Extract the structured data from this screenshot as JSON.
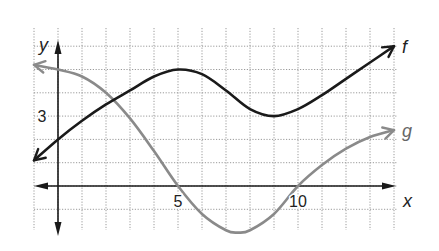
{
  "chart_data": {
    "type": "line",
    "title": "",
    "xlabel": "x",
    "ylabel": "y",
    "xlim": [
      -1,
      15
    ],
    "ylim": [
      -2,
      6
    ],
    "grid": true,
    "x_tick_labels": [
      {
        "value": 5,
        "label": "5"
      },
      {
        "value": 10,
        "label": "10"
      }
    ],
    "y_tick_labels": [
      {
        "value": 3,
        "label": "3"
      }
    ],
    "series": [
      {
        "name": "f",
        "label": "f",
        "color": "#1a1a1a",
        "x": [
          -1,
          0,
          1,
          2,
          3,
          4,
          5,
          6,
          7,
          8,
          9,
          10,
          11,
          12,
          13,
          14
        ],
        "y": [
          1.1,
          2,
          2.8,
          3.5,
          4.1,
          4.7,
          5,
          4.8,
          4.1,
          3.3,
          3,
          3.3,
          3.9,
          4.6,
          5.3,
          6
        ],
        "arrows": "both"
      },
      {
        "name": "g",
        "label": "g",
        "color": "#8a8a8a",
        "x": [
          -1,
          0,
          1,
          2,
          3,
          4,
          5,
          6,
          7,
          7.5,
          8,
          9,
          10,
          11,
          12,
          13,
          14
        ],
        "y": [
          5.2,
          5,
          4.7,
          4,
          2.9,
          1.5,
          0,
          -1.2,
          -1.9,
          -2,
          -1.9,
          -1.2,
          0,
          0.9,
          1.6,
          2.1,
          2.4
        ],
        "arrows": "both"
      }
    ]
  }
}
